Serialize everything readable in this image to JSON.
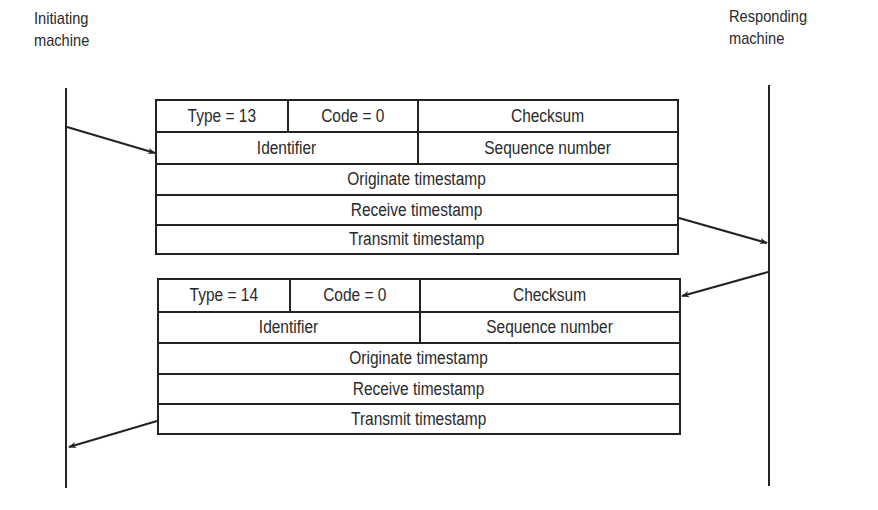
{
  "actors": {
    "initiator": {
      "line1": "Initiating",
      "line2": "machine"
    },
    "responder": {
      "line1": "Responding",
      "line2": "machine"
    }
  },
  "request_packet": {
    "type_label": "Type = 13",
    "code_label": "Code = 0",
    "checksum_label": "Checksum",
    "identifier_label": "Identifier",
    "sequence_label": "Sequence number",
    "originate_label": "Originate timestamp",
    "receive_label": "Receive timestamp",
    "transmit_label": "Transmit timestamp"
  },
  "reply_packet": {
    "type_label": "Type = 14",
    "code_label": "Code = 0",
    "checksum_label": "Checksum",
    "identifier_label": "Identifier",
    "sequence_label": "Sequence number",
    "originate_label": "Originate timestamp",
    "receive_label": "Receive timestamp",
    "transmit_label": "Transmit timestamp"
  },
  "colors": {
    "line": "#222222",
    "text": "#2a2a2a",
    "background": "#ffffff"
  }
}
